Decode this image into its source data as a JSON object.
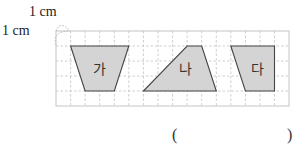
{
  "scale": {
    "horizontal_label": "1 cm",
    "vertical_label": "1 cm"
  },
  "grid": {
    "columns": 16,
    "rows": 5,
    "line_color": "#bdbdbd",
    "border_color": "#c4c4c4"
  },
  "shapes": [
    {
      "label": "가",
      "fill": "#d4d4d4"
    },
    {
      "label": "나",
      "fill": "#d4d4d4"
    },
    {
      "label": "다",
      "fill": "#d4d4d4"
    }
  ],
  "answer": {
    "open": "(",
    "close": ")",
    "value": ""
  }
}
